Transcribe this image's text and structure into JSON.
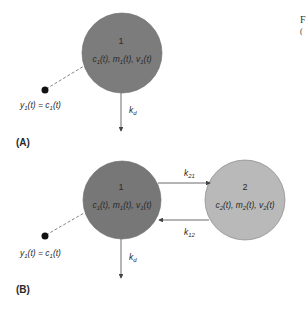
{
  "colors": {
    "compartment1": "#7c7c7c",
    "compartment2": "#b9b9b9",
    "stroke": "#555555",
    "text": "#2a2a2a"
  },
  "panel_a": {
    "label": "(A)",
    "compartment": {
      "number": "1",
      "vars": [
        "c",
        "1",
        "(t), ",
        "m",
        "1",
        "(t), ",
        "v",
        "1",
        "(t)"
      ]
    },
    "observation": {
      "y": "y",
      "ysub": "1",
      "mid": "(t) = ",
      "c": "c",
      "csub": "1",
      "end": "(t)"
    },
    "elimination": {
      "k": "k",
      "sub": "d"
    }
  },
  "panel_b": {
    "label": "(B)",
    "compartment1": {
      "number": "1",
      "vars": [
        "c",
        "1",
        "(t), ",
        "m",
        "1",
        "(t), ",
        "v",
        "1",
        "(t)"
      ]
    },
    "compartment2": {
      "number": "2",
      "vars": [
        "c",
        "2",
        "(t), ",
        "m",
        "2",
        "(t), ",
        "v",
        "2",
        "(t)"
      ]
    },
    "observation": {
      "y": "y",
      "ysub": "1",
      "mid": "(t) = ",
      "c": "c",
      "csub": "1",
      "end": "(t)"
    },
    "elimination": {
      "k": "k",
      "sub": "d"
    },
    "transfer_21": {
      "k": "k",
      "sub": "21"
    },
    "transfer_12": {
      "k": "k",
      "sub": "12"
    }
  },
  "cutoff_text": {
    "line1": "F",
    "line2": "("
  }
}
